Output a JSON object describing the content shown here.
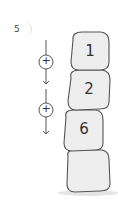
{
  "question": {
    "number": "5"
  },
  "operations": [
    {
      "symbol": "+"
    },
    {
      "symbol": "+"
    }
  ],
  "stones": [
    {
      "label": "1"
    },
    {
      "label": "2"
    },
    {
      "label": "6"
    },
    {
      "label": ""
    }
  ],
  "colors": {
    "stone_fill": "#eeeeee",
    "stone_stroke": "#555555",
    "line": "#555555",
    "background": "#ffffff"
  }
}
